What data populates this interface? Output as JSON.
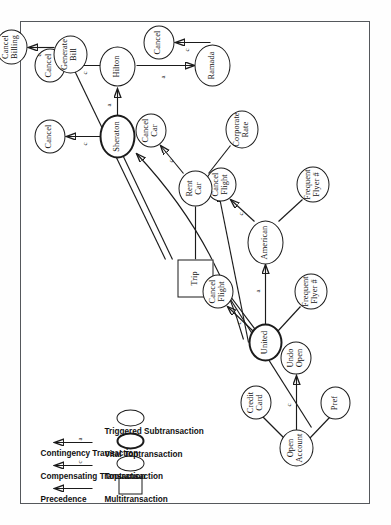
{
  "figure": {
    "kind": "transaction-hierarchy-diagram",
    "orientation": "rotated-90-ccw"
  },
  "nodes": [
    {
      "id": "trip",
      "label": "Trip",
      "shape": "rect",
      "type": "Multitransaction"
    },
    {
      "id": "open_account",
      "label": "Open\nAccount",
      "shape": "ellipse",
      "type": "Toptransaction"
    },
    {
      "id": "credit_card",
      "label": "Credit\nCard",
      "shape": "ellipse",
      "type": "Triggered Subtransaction"
    },
    {
      "id": "pref",
      "label": "Pref",
      "shape": "ellipse",
      "type": "Triggered Subtransaction"
    },
    {
      "id": "undo_open",
      "label": "Undo\nOpen",
      "shape": "ellipse",
      "type": "Triggered Subtransaction"
    },
    {
      "id": "united",
      "label": "United",
      "shape": "ellipse",
      "type": "Vital Toptransaction"
    },
    {
      "id": "cancel_flight_u",
      "label": "Cancel\nFlight",
      "shape": "ellipse",
      "type": "Triggered Subtransaction"
    },
    {
      "id": "frequent_flyer_u",
      "label": "Frequent\nFlyer #",
      "shape": "ellipse",
      "type": "Triggered Subtransaction"
    },
    {
      "id": "american",
      "label": "American",
      "shape": "ellipse",
      "type": "Toptransaction"
    },
    {
      "id": "cancel_flight_a",
      "label": "Cancel\nFlight",
      "shape": "ellipse",
      "type": "Triggered Subtransaction"
    },
    {
      "id": "frequent_flyer_a",
      "label": "Frequent\nFlyer #",
      "shape": "ellipse",
      "type": "Triggered Subtransaction"
    },
    {
      "id": "rent_car",
      "label": "Rent\nCar",
      "shape": "ellipse",
      "type": "Toptransaction"
    },
    {
      "id": "cancel_car",
      "label": "Cancel\nCar",
      "shape": "ellipse",
      "type": "Triggered Subtransaction"
    },
    {
      "id": "corporate_rate",
      "label": "Corporate\nRate",
      "shape": "ellipse",
      "type": "Triggered Subtransaction"
    },
    {
      "id": "sheraton",
      "label": "Sheraton",
      "shape": "ellipse",
      "type": "Vital Toptransaction"
    },
    {
      "id": "cancel_sheraton",
      "label": "Cancel",
      "shape": "ellipse",
      "type": "Triggered Subtransaction"
    },
    {
      "id": "hilton",
      "label": "Hilton",
      "shape": "ellipse",
      "type": "Toptransaction"
    },
    {
      "id": "cancel_hilton",
      "label": "Cancel",
      "shape": "ellipse",
      "type": "Triggered Subtransaction"
    },
    {
      "id": "ramada",
      "label": "Ramada",
      "shape": "ellipse",
      "type": "Toptransaction"
    },
    {
      "id": "cancel_ramada",
      "label": "Cancel",
      "shape": "ellipse",
      "type": "Triggered Subtransaction"
    },
    {
      "id": "generate_bill",
      "label": "Generate\nBill",
      "shape": "ellipse",
      "type": "Toptransaction"
    },
    {
      "id": "cancel_billing",
      "label": "Cancel\nBilling",
      "shape": "ellipse",
      "type": "Triggered Subtransaction"
    }
  ],
  "edges": [
    {
      "from": "trip",
      "to": "open_account",
      "label": "",
      "kind": "membership"
    },
    {
      "from": "trip",
      "to": "united",
      "label": "",
      "kind": "membership"
    },
    {
      "from": "trip",
      "to": "rent_car",
      "label": "",
      "kind": "membership"
    },
    {
      "from": "trip",
      "to": "sheraton",
      "label": "",
      "kind": "membership"
    },
    {
      "from": "trip",
      "to": "generate_bill",
      "label": "",
      "kind": "membership"
    },
    {
      "from": "open_account",
      "to": "credit_card",
      "label": "",
      "kind": "membership"
    },
    {
      "from": "open_account",
      "to": "pref",
      "label": "",
      "kind": "membership"
    },
    {
      "from": "open_account",
      "to": "undo_open",
      "label": "c",
      "kind": "compensating"
    },
    {
      "from": "united",
      "to": "cancel_flight_u",
      "label": "c",
      "kind": "compensating"
    },
    {
      "from": "united",
      "to": "frequent_flyer_u",
      "label": "",
      "kind": "membership"
    },
    {
      "from": "united",
      "to": "american",
      "label": "a",
      "kind": "contingency"
    },
    {
      "from": "united",
      "to": "rent_car",
      "label": "",
      "kind": "precedence"
    },
    {
      "from": "united",
      "to": "sheraton",
      "label": "",
      "kind": "precedence"
    },
    {
      "from": "american",
      "to": "cancel_flight_a",
      "label": "c",
      "kind": "compensating"
    },
    {
      "from": "american",
      "to": "frequent_flyer_a",
      "label": "",
      "kind": "membership"
    },
    {
      "from": "rent_car",
      "to": "cancel_car",
      "label": "c",
      "kind": "compensating"
    },
    {
      "from": "rent_car",
      "to": "corporate_rate",
      "label": "",
      "kind": "membership"
    },
    {
      "from": "sheraton",
      "to": "cancel_sheraton",
      "label": "c",
      "kind": "compensating"
    },
    {
      "from": "sheraton",
      "to": "hilton",
      "label": "a",
      "kind": "contingency"
    },
    {
      "from": "hilton",
      "to": "cancel_hilton",
      "label": "c",
      "kind": "compensating"
    },
    {
      "from": "hilton",
      "to": "ramada",
      "label": "a",
      "kind": "contingency"
    },
    {
      "from": "ramada",
      "to": "cancel_ramada",
      "label": "c",
      "kind": "compensating"
    },
    {
      "from": "generate_bill",
      "to": "cancel_billing",
      "label": "c",
      "kind": "compensating"
    }
  ],
  "legend": {
    "shapes": [
      {
        "name": "Multitransaction",
        "shape": "rect"
      },
      {
        "name": "Toptransaction",
        "shape": "ellipse-thin"
      },
      {
        "name": "Vital Toptransaction",
        "shape": "ellipse-thick"
      },
      {
        "name": "Triggered Subtransaction",
        "shape": "ellipse-thin"
      }
    ],
    "arrows": [
      {
        "name": "Precedence",
        "marker": ""
      },
      {
        "name": "Compensating Transaction",
        "marker": "c"
      },
      {
        "name": "Contingency Transaction",
        "marker": "a"
      }
    ]
  }
}
